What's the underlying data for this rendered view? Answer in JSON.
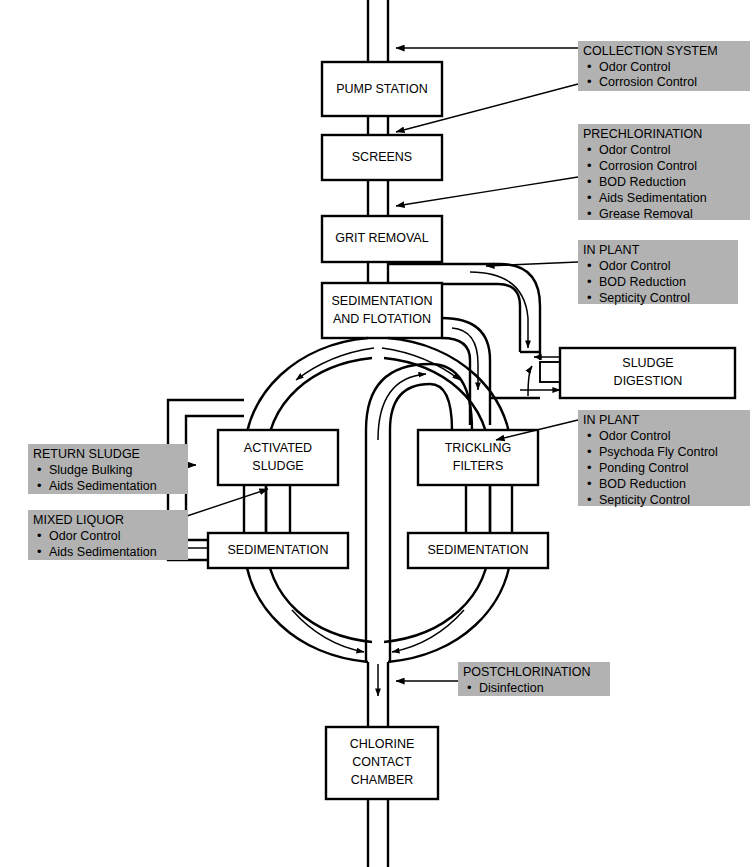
{
  "diagram": {
    "units": [
      {
        "id": "pump-station",
        "lines": [
          "PUMP STATION"
        ]
      },
      {
        "id": "screens",
        "lines": [
          "SCREENS"
        ]
      },
      {
        "id": "grit-removal",
        "lines": [
          "GRIT REMOVAL"
        ]
      },
      {
        "id": "sedimentation-flotation",
        "lines": [
          "SEDIMENTATION",
          "AND FLOTATION"
        ]
      },
      {
        "id": "sludge-digestion",
        "lines": [
          "SLUDGE",
          "DIGESTION"
        ]
      },
      {
        "id": "activated-sludge",
        "lines": [
          "ACTIVATED",
          "SLUDGE"
        ]
      },
      {
        "id": "trickling-filters",
        "lines": [
          "TRICKLING",
          "FILTERS"
        ]
      },
      {
        "id": "sedimentation-left",
        "lines": [
          "SEDIMENTATION"
        ]
      },
      {
        "id": "sedimentation-right",
        "lines": [
          "SEDIMENTATION"
        ]
      },
      {
        "id": "chlorine-contact-chamber",
        "lines": [
          "CHLORINE",
          "CONTACT",
          "CHAMBER"
        ]
      }
    ],
    "annotations": [
      {
        "id": "collection-system",
        "title": "COLLECTION SYSTEM",
        "items": [
          "Odor Control",
          "Corrosion Control"
        ]
      },
      {
        "id": "prechlorination",
        "title": "PRECHLORINATION",
        "items": [
          "Odor Control",
          "Corrosion Control",
          "BOD Reduction",
          "Aids Sedimentation",
          "Grease Removal"
        ]
      },
      {
        "id": "in-plant-upper",
        "title": "IN PLANT",
        "items": [
          "Odor Control",
          "BOD Reduction",
          "Septicity Control"
        ]
      },
      {
        "id": "in-plant-lower",
        "title": "IN PLANT",
        "items": [
          "Odor Control",
          "Psychoda Fly Control",
          "Ponding Control",
          "BOD Reduction",
          "Septicity Control"
        ]
      },
      {
        "id": "return-sludge",
        "title": "RETURN SLUDGE",
        "items": [
          "Sludge Bulking",
          "Aids Sedimentation"
        ]
      },
      {
        "id": "mixed-liquor",
        "title": "MIXED LIQUOR",
        "items": [
          "Odor Control",
          "Aids Sedimentation"
        ]
      },
      {
        "id": "postchlorination",
        "title": "POSTCHLORINATION",
        "items": [
          "Disinfection"
        ]
      }
    ],
    "colors": {
      "annotation_background": "#b2b2b2",
      "line": "#000000",
      "unit_fill": "#ffffff",
      "page_background": "#ffffff"
    }
  }
}
